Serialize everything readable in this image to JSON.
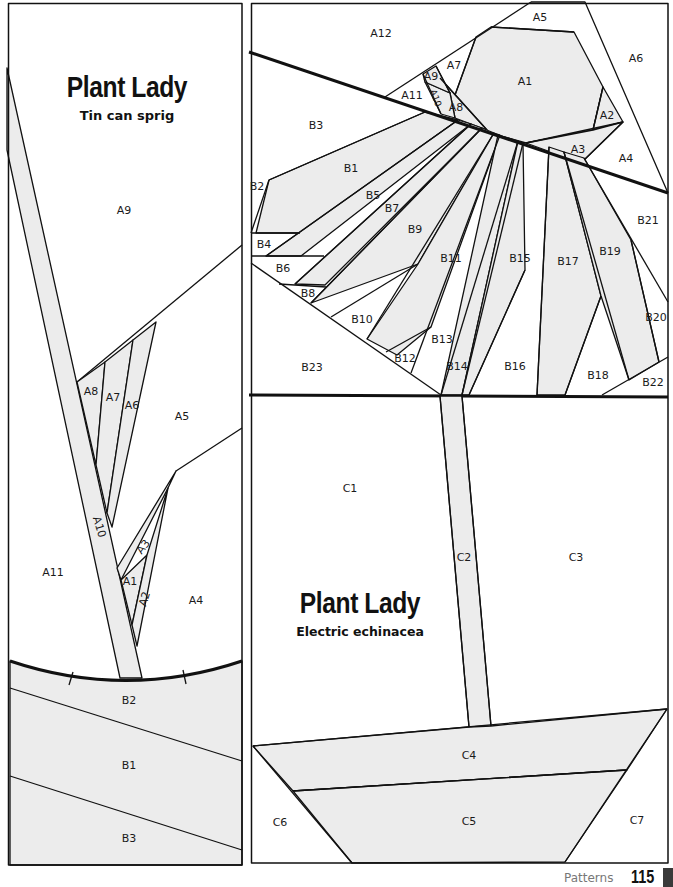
{
  "left_panel": {
    "title": "Plant Lady",
    "subtitle": "Tin can sprig",
    "labels": {
      "A1": "A1",
      "A2": "A2",
      "A3": "A3",
      "A4": "A4",
      "A5": "A5",
      "A6": "A6",
      "A7": "A7",
      "A8": "A8",
      "A9": "A9",
      "A10": "A10",
      "A11": "A11",
      "B1": "B1",
      "B2": "B2",
      "B3": "B3"
    }
  },
  "right_panel": {
    "title": "Plant Lady",
    "subtitle": "Electric echinacea",
    "labels": {
      "A1": "A1",
      "A2": "A2",
      "A3": "A3",
      "A4": "A4",
      "A5": "A5",
      "A6": "A6",
      "A7": "A7",
      "A8": "A8",
      "A9": "A9",
      "A10": "A10",
      "A11": "A11",
      "A12": "A12",
      "B1": "B1",
      "B2": "B2",
      "B3": "B3",
      "B4": "B4",
      "B5": "B5",
      "B6": "B6",
      "B7": "B7",
      "B8": "B8",
      "B9": "B9",
      "B10": "B10",
      "B11": "B11",
      "B12": "B12",
      "B13": "B13",
      "B14": "B14",
      "B15": "B15",
      "B16": "B16",
      "B17": "B17",
      "B18": "B18",
      "B19": "B19",
      "B20": "B20",
      "B21": "B21",
      "B22": "B22",
      "B23": "B23",
      "C1": "C1",
      "C2": "C2",
      "C3": "C3",
      "C4": "C4",
      "C5": "C5",
      "C6": "C6",
      "C7": "C7"
    }
  },
  "footer": {
    "section": "Patterns",
    "page_number": "115"
  },
  "colors": {
    "shaded": "#ececec",
    "line": "#111111"
  }
}
